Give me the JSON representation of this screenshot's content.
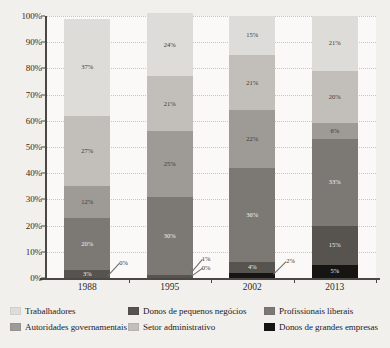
{
  "chart_data": {
    "type": "bar",
    "subtype": "stacked-percentage",
    "title": "",
    "xlabel": "",
    "ylabel": "",
    "ylim": [
      0,
      100
    ],
    "grid": true,
    "legend_position": "bottom",
    "categories": [
      "1988",
      "1995",
      "2002",
      "2013"
    ],
    "tick_labels": [
      "0%",
      "10%",
      "20%",
      "30%",
      "40%",
      "50%",
      "60%",
      "70%",
      "80%",
      "90%",
      "100%"
    ],
    "tick_values": [
      0,
      10,
      20,
      30,
      40,
      50,
      60,
      70,
      80,
      90,
      100
    ],
    "series": [
      {
        "name": "Donos de grandes empresas",
        "color": "#171513",
        "values": [
          0,
          0,
          2,
          5
        ],
        "labels": [
          "0%",
          "0%",
          "2%",
          "5%"
        ],
        "label_mode": [
          "callout",
          "callout",
          "callout",
          "inside"
        ]
      },
      {
        "name": "Donos de pequenos negócios",
        "color": "#57534f",
        "values": [
          3,
          1,
          4,
          15
        ],
        "labels": [
          "3%",
          "1%",
          "4%",
          "15%"
        ],
        "label_mode": [
          "inside",
          "callout",
          "inside",
          "inside"
        ]
      },
      {
        "name": "Profissionais liberais",
        "color": "#7c7975",
        "values": [
          20,
          30,
          36,
          33
        ],
        "labels": [
          "20%",
          "30%",
          "36%",
          "33%"
        ],
        "label_mode": [
          "inside",
          "inside",
          "inside",
          "inside"
        ]
      },
      {
        "name": "Autoridades governamentais",
        "color": "#9e9b97",
        "values": [
          12,
          25,
          22,
          6
        ],
        "labels": [
          "12%",
          "25%",
          "22%",
          "6%"
        ],
        "label_mode": [
          "inside",
          "inside",
          "inside",
          "inside"
        ]
      },
      {
        "name": "Setor administrativo",
        "color": "#c2bfba",
        "values": [
          27,
          21,
          21,
          20
        ],
        "labels": [
          "27%",
          "21%",
          "21%",
          "20%"
        ],
        "label_mode": [
          "inside",
          "inside",
          "inside",
          "inside"
        ]
      },
      {
        "name": "Trabalhadores",
        "color": "#dedcd8",
        "values": [
          37,
          24,
          15,
          21
        ],
        "labels": [
          "37%",
          "24%",
          "15%",
          "21%"
        ],
        "label_mode": [
          "inside",
          "inside",
          "inside",
          "inside"
        ]
      }
    ]
  },
  "legend": {
    "items": [
      {
        "label": "Trabalhadores",
        "color": "#dedcd8"
      },
      {
        "label": "Autoridades governamentais",
        "color": "#9e9b97"
      },
      {
        "label": "Donos de pequenos negócios",
        "color": "#57534f"
      },
      {
        "label": "Setor administrativo",
        "color": "#c2bfba"
      },
      {
        "label": "Profissionais liberais",
        "color": "#7c7975"
      },
      {
        "label": "Donos de grandes empresas",
        "color": "#171513"
      }
    ]
  },
  "callouts": [
    {
      "text": "0%",
      "category": "1988"
    },
    {
      "text": "1%",
      "category": "1995"
    },
    {
      "text": "0%",
      "category": "1995"
    },
    {
      "text": "2%",
      "category": "2002"
    }
  ]
}
